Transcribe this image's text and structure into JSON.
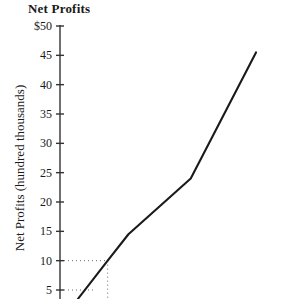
{
  "chart": {
    "title": "Net Profits",
    "y_axis_label": "Net Profits (hundred thousands)"
  },
  "chart_data": {
    "type": "line",
    "title": "Net Profits",
    "xlabel": "",
    "ylabel": "Net Profits (hundred thousands)",
    "ylim": [
      0,
      50
    ],
    "ytick_labels": [
      "$50",
      "45",
      "40",
      "35",
      "30",
      "25",
      "20",
      "15",
      "10",
      "5"
    ],
    "ytick_values": [
      50,
      45,
      40,
      35,
      30,
      25,
      20,
      15,
      10,
      5
    ],
    "grid": false,
    "legend": null,
    "axis_line_color": "#333333",
    "series_color": "#1a1a1a",
    "guide_color": "#6b6b6b",
    "series": [
      {
        "name": "Net Profits",
        "points": [
          {
            "x": 0.0,
            "y": 3.5
          },
          {
            "x": 1.0,
            "y": 10.0
          },
          {
            "x": 1.7,
            "y": 14.5
          },
          {
            "x": 3.8,
            "y": 24.0
          },
          {
            "x": 6.0,
            "y": 45.5
          }
        ]
      }
    ],
    "guides": [
      {
        "type": "horizontal",
        "value": 10,
        "from_x": 0.0,
        "to_x": 1.0
      },
      {
        "type": "horizontal",
        "value": 5,
        "from_x": 0.0,
        "to_x": 0.52
      },
      {
        "type": "vertical",
        "at_x": 1.0,
        "from_y": 10,
        "to_y": 0
      }
    ]
  }
}
